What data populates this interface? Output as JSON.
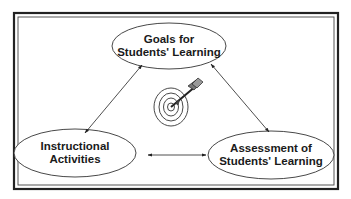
{
  "diagram": {
    "type": "triangle-cycle",
    "nodes": [
      {
        "id": "goals",
        "line1": "Goals for",
        "line2": "Students' Learning"
      },
      {
        "id": "instruction",
        "line1": "Instructional",
        "line2": "Activities"
      },
      {
        "id": "assessment",
        "line1": "Assessment of",
        "line2": "Students' Learning"
      }
    ],
    "edges": [
      {
        "from": "goals",
        "to": "instruction",
        "direction": "bidirectional"
      },
      {
        "from": "goals",
        "to": "assessment",
        "direction": "bidirectional"
      },
      {
        "from": "instruction",
        "to": "assessment",
        "direction": "bidirectional"
      }
    ],
    "center_icon": "target-with-arrow-icon",
    "colors": {
      "line": "#2a2a2a",
      "background": "#ffffff"
    }
  }
}
